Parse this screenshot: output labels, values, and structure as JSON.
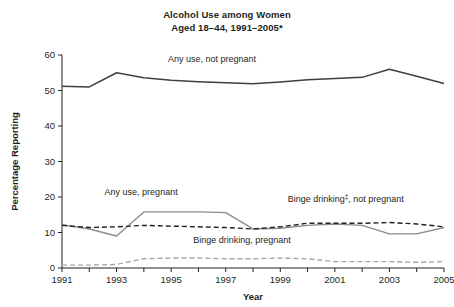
{
  "chart_data": {
    "type": "line",
    "title": "Alcohol Use among Women Aged 18–44, 1991–2005*",
    "title_line1": "Alcohol Use among Women",
    "title_line2": "Aged 18–44, 1991–2005*",
    "xlabel": "Year",
    "ylabel": "Percentage Reporting",
    "xlim": [
      1991,
      2005
    ],
    "ylim": [
      0,
      60
    ],
    "ytick_step": 10,
    "grid": false,
    "legend_position": "inline-annotations",
    "x": [
      1991,
      1992,
      1993,
      1994,
      1995,
      1996,
      1997,
      1998,
      1999,
      2000,
      2001,
      2002,
      2003,
      2004,
      2005
    ],
    "xticks": [
      1991,
      1993,
      1995,
      1997,
      1999,
      2001,
      2003,
      2005
    ],
    "xtick_labels": [
      "1991",
      "1993",
      "1995",
      "1997",
      "1999",
      "2001",
      "2003",
      "2005"
    ],
    "yticks": [
      0,
      10,
      20,
      30,
      40,
      50,
      60
    ],
    "ytick_labels": [
      "0",
      "10",
      "20",
      "30",
      "40",
      "50",
      "60"
    ],
    "series": [
      {
        "name": "Any use, not pregnant",
        "label": "Any use, not pregnant",
        "color": "#3f3f3f",
        "style": "solid",
        "values": [
          51.2,
          51.0,
          55.0,
          53.6,
          52.9,
          52.5,
          52.2,
          51.9,
          52.4,
          53.0,
          53.4,
          53.7,
          56.0,
          54.0,
          52.0
        ]
      },
      {
        "name": "Any use, pregnant",
        "label": "Any use, pregnant",
        "color": "#8c8c8c",
        "style": "solid",
        "values": [
          12.2,
          11.0,
          9.0,
          15.8,
          15.8,
          15.8,
          15.6,
          11.0,
          11.2,
          12.0,
          12.4,
          12.0,
          9.6,
          9.6,
          11.4
        ]
      },
      {
        "name": "Binge drinking, not pregnant",
        "label": "Binge drinking‡, not pregnant",
        "label_text": "Binge drinking",
        "label_sup": "‡",
        "label_tail": ", not pregnant",
        "color": "#231f20",
        "style": "dashed",
        "values": [
          12.0,
          11.4,
          11.6,
          12.0,
          11.8,
          11.6,
          11.4,
          11.0,
          11.6,
          12.6,
          12.6,
          12.6,
          12.8,
          12.4,
          11.6
        ]
      },
      {
        "name": "Binge drinking, pregnant",
        "label": "Binge drinking, pregnant",
        "color": "#a6a6a6",
        "style": "dashed",
        "values": [
          0.8,
          0.8,
          1.0,
          2.6,
          2.8,
          2.8,
          2.6,
          2.6,
          2.8,
          2.6,
          1.8,
          1.8,
          1.8,
          1.6,
          1.8
        ]
      }
    ],
    "annotations": [
      {
        "text": "Any use, not pregnant",
        "x": 1996.5,
        "y": 58.0
      },
      {
        "text": "Any use, pregnant",
        "x": 1993.9,
        "y": 20.6
      },
      {
        "text": "Binge drinking‡, not pregnant",
        "x": 2001.4,
        "y": 18.5
      },
      {
        "text": "Binge drinking, pregnant",
        "x": 1997.6,
        "y": 7.0
      }
    ]
  }
}
